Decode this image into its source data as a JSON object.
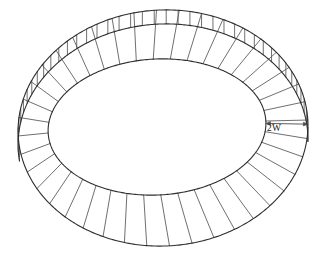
{
  "figure": {
    "background_color": "#ffffff",
    "line_color": "#2e2e2e",
    "spoke_color": "#555555",
    "dimension_color": "#4a4a4a",
    "label_color": "#222222"
  },
  "annotations": [
    {
      "id": "band-width",
      "text": "2W",
      "x": 274,
      "y": 131
    }
  ],
  "chart_data": {
    "type": "diagram",
    "shapes": [
      {
        "name": "outer-top-ellipse",
        "kind": "ellipse",
        "cx": 163,
        "cy": 128,
        "rx": 145,
        "ry": 118
      },
      {
        "name": "outer-bottom-ellipse",
        "kind": "ellipse",
        "cx": 163,
        "cy": 130,
        "rx": 145,
        "ry": 118,
        "offset_y": 14
      },
      {
        "name": "inner-ellipse",
        "kind": "ellipse",
        "cx": 157,
        "cy": 127,
        "rx": 109,
        "ry": 68
      }
    ],
    "spoke_count": 40,
    "wall_line_count": 40,
    "labels": [
      "2W"
    ]
  }
}
